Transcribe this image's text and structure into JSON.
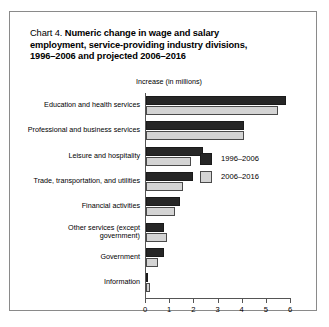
{
  "chart_data": {
    "type": "bar",
    "orientation": "horizontal",
    "title_lines": [
      "Chart 4. Numeric change in wage and salary",
      "employment, service-providing industry divisions,",
      "1996–2006 and projected 2006–2016"
    ],
    "title_lead": "Chart 4.",
    "xlabel": "Increase (in millions)",
    "ylabel": "",
    "xlim": [
      0,
      6
    ],
    "xticks": [
      0,
      1,
      2,
      3,
      4,
      5,
      6
    ],
    "xtick_labels": [
      "0",
      "1",
      "2",
      "3",
      "4",
      "5",
      "6"
    ],
    "grid": false,
    "legend_position": "inside-right",
    "categories": [
      "Education and health services",
      "Professional and business services",
      "Leisure and hospitality",
      "Trade, transportation, and utilities",
      "Other services (except government)",
      "Financial activities",
      "Government",
      "Information"
    ],
    "category_labels": [
      [
        "Education and health services"
      ],
      [
        "Professional and business services"
      ],
      [
        "Leisure and hospitality"
      ],
      [
        "Trade, transportation, and utilities"
      ],
      [
        "Financial activities"
      ],
      [
        "Other services (except",
        "government)"
      ],
      [
        "Government"
      ],
      [
        "Information"
      ]
    ],
    "series": [
      {
        "name": "1996–2006",
        "color": "#262626",
        "values": [
          5.8,
          4.05,
          2.35,
          1.95,
          1.4,
          0.75,
          0.75,
          0.05
        ]
      },
      {
        "name": "2006–2016",
        "color": "#d4d4d4",
        "values": [
          5.45,
          4.05,
          1.85,
          1.55,
          1.2,
          0.85,
          0.5,
          0.15
        ]
      }
    ],
    "rows": [
      {
        "category_lines": [
          "Education and health services"
        ],
        "v0": 5.8,
        "v1": 5.45
      },
      {
        "category_lines": [
          "Professional and business services"
        ],
        "v0": 4.05,
        "v1": 4.05
      },
      {
        "category_lines": [
          "Leisure and hospitality"
        ],
        "v0": 2.35,
        "v1": 1.85
      },
      {
        "category_lines": [
          "Trade, transportation, and utilities"
        ],
        "v0": 1.95,
        "v1": 1.55
      },
      {
        "category_lines": [
          "Financial activities"
        ],
        "v0": 1.4,
        "v1": 1.2
      },
      {
        "category_lines": [
          "Other services (except",
          "government)"
        ],
        "v0": 0.75,
        "v1": 0.85
      },
      {
        "category_lines": [
          "Government"
        ],
        "v0": 0.75,
        "v1": 0.5
      },
      {
        "category_lines": [
          "Information"
        ],
        "v0": 0.05,
        "v1": 0.15
      }
    ]
  },
  "legend": {
    "entries": [
      {
        "label": "1996–2006"
      },
      {
        "label": "2006–2016"
      }
    ]
  }
}
